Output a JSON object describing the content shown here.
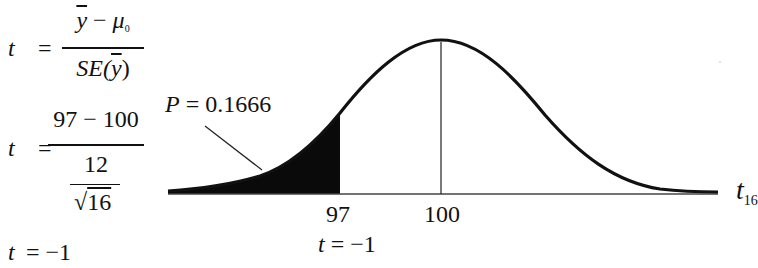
{
  "formulas": {
    "line1": {
      "lhs": "t",
      "equals": "=",
      "numerator_var": "y",
      "numerator_op": " − ",
      "numerator_mu": "μ",
      "numerator_mu_sub": "0",
      "denominator_pre": "SE(",
      "denominator_var": "y",
      "denominator_post": ")"
    },
    "line2": {
      "lhs": "t",
      "equals": "=",
      "numerator": "97 − 100",
      "denominator_num": "12",
      "denominator_sqrt_arg": "16",
      "sqrt_symbol": "√"
    },
    "line3": {
      "lhs": "t",
      "rest": "= −1"
    }
  },
  "diagram": {
    "p_label_var": "P",
    "p_label_rest": "= 0.1666",
    "tick_left": "97",
    "tick_mean": "100",
    "t_under_tick_var": "t",
    "t_under_tick_rest": "= −1",
    "axis_label_var": "t",
    "axis_label_sub": "16",
    "colors": {
      "curve": "#111111",
      "shade": "#0a0a0a",
      "baseline": "#333333"
    }
  }
}
